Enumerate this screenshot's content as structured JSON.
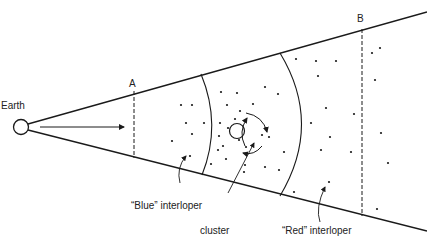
{
  "diagram": {
    "labels": {
      "earth": "Earth",
      "a": "A",
      "b": "B",
      "blue_interloper": "“Blue” interloper",
      "cluster": "cluster",
      "red_interloper": "“Red” interloper"
    },
    "colors": {
      "line": "#1a1a1a",
      "background": "#ffffff"
    }
  }
}
